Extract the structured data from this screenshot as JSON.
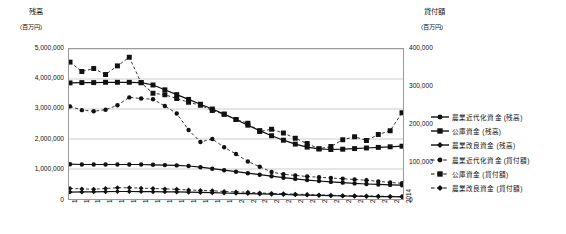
{
  "chart_data": {
    "type": "line",
    "title": "",
    "x": [
      1986,
      1987,
      1988,
      1989,
      1990,
      1991,
      1992,
      1993,
      1994,
      1995,
      1996,
      1997,
      1998,
      1999,
      2000,
      2001,
      2002,
      2003,
      2004,
      2005,
      2006,
      2007,
      2008,
      2009,
      2010,
      2011,
      2012,
      2013,
      2014
    ],
    "xlabel": "",
    "ylabel": "残高",
    "ylabel_right": "貸付額",
    "yunit": "(百万円)",
    "yunit_right": "(百万円)",
    "ylim": [
      0,
      5000000
    ],
    "yticks": [
      "0",
      "1,000,000",
      "2,000,000",
      "3,000,000",
      "4,000,000",
      "5,000,000"
    ],
    "ylim_right": [
      0,
      400000
    ],
    "yticks_right": [
      "0",
      "100,000",
      "200,000",
      "300,000",
      "400,000"
    ],
    "grid": true,
    "legend_position": "right",
    "series": [
      {
        "name": "農業近代化資金 (残高)",
        "axis": "left",
        "marker": "circle",
        "line": "solid",
        "values": [
          1160000,
          1150000,
          1150000,
          1150000,
          1150000,
          1150000,
          1150000,
          1140000,
          1130000,
          1120000,
          1100000,
          1060000,
          1010000,
          960000,
          910000,
          860000,
          810000,
          760000,
          710000,
          670000,
          630000,
          600000,
          570000,
          545000,
          520000,
          500000,
          485000,
          470000,
          460000
        ]
      },
      {
        "name": "公庫資金 (残高)",
        "axis": "left",
        "marker": "square",
        "line": "solid",
        "values": [
          3870000,
          3880000,
          3880000,
          3890000,
          3890000,
          3890000,
          3880000,
          3800000,
          3640000,
          3480000,
          3320000,
          3160000,
          3000000,
          2830000,
          2650000,
          2460000,
          2280000,
          2110000,
          1960000,
          1830000,
          1730000,
          1670000,
          1650000,
          1660000,
          1680000,
          1700000,
          1720000,
          1740000,
          1760000
        ]
      },
      {
        "name": "農業改良資金 (残高)",
        "axis": "left",
        "marker": "diamond",
        "line": "solid",
        "values": [
          230000,
          235000,
          240000,
          245000,
          250000,
          250000,
          248000,
          245000,
          240000,
          235000,
          228000,
          220000,
          210000,
          200000,
          190000,
          180000,
          170000,
          160000,
          150000,
          140000,
          130000,
          120000,
          110000,
          100000,
          92000,
          85000,
          80000,
          76000,
          72000
        ]
      },
      {
        "name": "農業近代化資金 (貸付額)",
        "axis": "right",
        "marker": "circle",
        "line": "dashed",
        "values": [
          247000,
          237000,
          234000,
          238000,
          250000,
          271000,
          268000,
          266000,
          248000,
          228000,
          184000,
          152000,
          160000,
          138000,
          120000,
          100000,
          86000,
          72000,
          66000,
          63000,
          60000,
          58000,
          56000,
          54000,
          52000,
          50000,
          47000,
          44000,
          42000
        ]
      },
      {
        "name": "公庫資金 (貸付額)",
        "axis": "right",
        "marker": "square",
        "line": "dashed",
        "values": [
          365000,
          340000,
          348000,
          332000,
          355000,
          378000,
          310000,
          282000,
          278000,
          268000,
          258000,
          250000,
          236000,
          226000,
          212000,
          202000,
          180000,
          186000,
          176000,
          162000,
          148000,
          134000,
          140000,
          158000,
          166000,
          156000,
          172000,
          182000,
          230000
        ]
      },
      {
        "name": "農業改良資金 (貸付額)",
        "axis": "right",
        "marker": "diamond",
        "line": "dashed",
        "values": [
          28000,
          27000,
          26000,
          28000,
          30000,
          30000,
          29000,
          28000,
          27000,
          26000,
          24000,
          23000,
          22000,
          20000,
          19000,
          18000,
          16000,
          15000,
          14000,
          13000,
          12000,
          11000,
          10000,
          9000,
          8500,
          8000,
          7500,
          7000,
          6500
        ]
      }
    ]
  },
  "axes": {
    "left_title": "残高",
    "left_unit": "(百万円)",
    "right_title": "貸付額",
    "right_unit": "(百万円)"
  }
}
